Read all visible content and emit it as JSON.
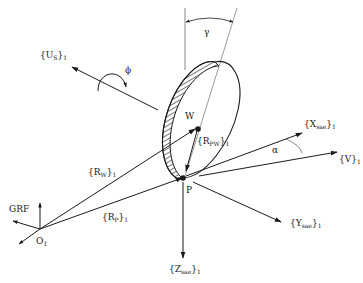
{
  "diagram": {
    "labels": {
      "us_brace": "{U",
      "us_sub": "S",
      "us_close": "}",
      "us_idx": "1",
      "phi": "ϕ",
      "gamma": "γ",
      "w": "W",
      "rpw_open": "{R",
      "rpw_sub": "PW",
      "rpw_close": "}",
      "rpw_idx": "1",
      "xsae_open": "{X",
      "xsae_sub": "sae",
      "xsae_close": "}",
      "xsae_idx": "1",
      "alpha": "α",
      "v_open": "{V}",
      "v_idx": "1",
      "rw_open": "{R",
      "rw_sub": "W",
      "rw_close": "}",
      "rw_idx": "1",
      "p": "P",
      "grf": "GRF",
      "rp_open": "{R",
      "rp_sub": "P",
      "rp_close": "}",
      "rp_idx": "1",
      "o1": "O",
      "o1_idx": "1",
      "ysae_open": "{Y",
      "ysae_sub": "sae",
      "ysae_close": "}",
      "ysae_idx": "1",
      "zsae_open": "{Z",
      "zsae_sub": "sae",
      "zsae_close": "}",
      "zsae_idx": "1"
    },
    "points": {
      "O1": [
        38,
        230
      ],
      "P": [
        185,
        176
      ],
      "W": [
        197,
        128
      ]
    },
    "colors": {
      "line": "#1a1a1a",
      "thin": "#555555",
      "background": "#ffffff"
    }
  }
}
